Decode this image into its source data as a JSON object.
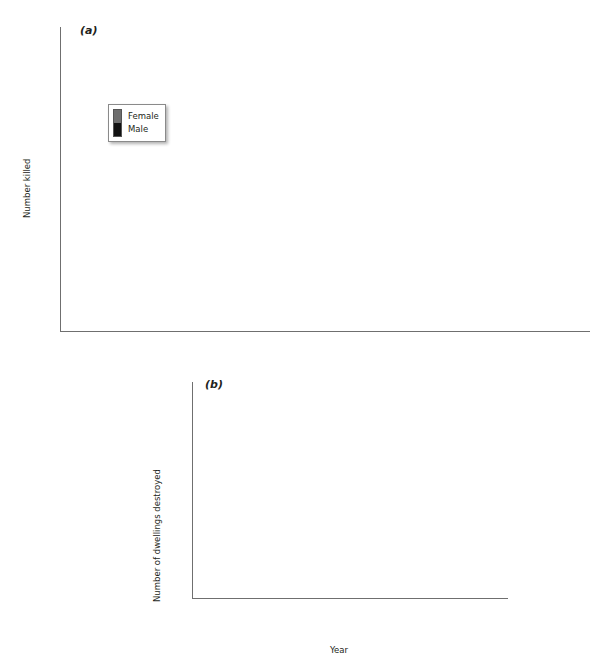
{
  "figure": {
    "background": "#ffffff",
    "male_color": "#111111",
    "female_color": "#6e6e6e",
    "axis_color": "#6f6f6f"
  },
  "panel_a": {
    "letter": "(a)",
    "ytitle": "Number killed",
    "yticks": [
      "0",
      "10",
      "20",
      "30",
      "40",
      "50",
      "60",
      "70",
      "80"
    ],
    "legend": {
      "female": "Female",
      "male": "Male"
    }
  },
  "panel_b": {
    "letter": "(b)",
    "ytitle": "Number of dwellings destroyed",
    "xtitle": "Year",
    "yticks": [
      "0",
      "500",
      "1000",
      "1500",
      "2000",
      "2500"
    ],
    "annotations": [
      {
        "name": "Black Friday",
        "year": "1939"
      },
      {
        "name": "Hobart",
        "year": "1967"
      },
      {
        "name": "Ash Wednesday",
        "year": "1983"
      },
      {
        "name": "Sydney",
        "year": "1994"
      },
      {
        "name": "Canberra",
        "year": "2003"
      }
    ]
  },
  "chart_data": [
    {
      "type": "bar",
      "id": "panel_a",
      "title": "(a)",
      "subtitle": "Bushfire fatalities by year, split by sex",
      "stacked": true,
      "xlabel": "",
      "ylabel": "Number killed",
      "ylim": [
        0,
        80
      ],
      "ytick_step": 10,
      "grid": false,
      "legend": [
        "Female",
        "Male"
      ],
      "legend_position": "upper-left-inside",
      "tick_labels": [
        "1904",
        "1908",
        "1915",
        "1919",
        "1926",
        "1932",
        "1936",
        "1942",
        "1951",
        "1954",
        "1958",
        "1965",
        "1969",
        "1977",
        "1980",
        "1985",
        "1994",
        "2002",
        "2006"
      ],
      "categories": [
        "1901",
        "1904",
        "1905",
        "1906",
        "1908",
        "1912",
        "1915",
        "1916",
        "1919",
        "1920",
        "1922",
        "1926",
        "1929",
        "1932",
        "1933",
        "1936",
        "1939",
        "1940",
        "1942",
        "1943",
        "1944",
        "1951",
        "1952",
        "1954",
        "1955",
        "1958",
        "1959",
        "1962",
        "1965",
        "1967",
        "1969",
        "1972",
        "1977",
        "1978",
        "1980",
        "1983",
        "1985",
        "1990",
        "1994",
        "1997",
        "2002",
        "2003",
        "2005",
        "2006",
        "2007"
      ],
      "series": [
        {
          "name": "Male",
          "values": [
            1,
            8,
            5,
            14,
            4,
            1,
            1,
            1,
            4,
            1,
            3,
            2,
            5,
            1,
            3,
            1,
            68,
            1,
            29,
            1,
            1,
            13,
            1,
            2,
            4,
            4,
            1,
            12,
            36,
            2,
            5,
            3,
            7,
            1,
            1,
            36,
            5,
            2,
            5,
            3,
            6,
            4,
            3,
            5,
            4
          ]
        },
        {
          "name": "Female",
          "values": [
            0,
            1,
            0,
            2,
            0,
            0,
            0,
            0,
            0,
            0,
            0,
            0,
            1,
            0,
            0,
            0,
            11,
            0,
            13,
            0,
            0,
            7,
            0,
            0,
            0,
            1,
            0,
            5,
            29,
            1,
            4,
            0,
            1,
            0,
            0,
            24,
            2,
            0,
            1,
            0,
            3,
            1,
            0,
            0,
            1
          ]
        }
      ],
      "total_values": [
        1,
        9,
        5,
        16,
        4,
        1,
        1,
        1,
        4,
        1,
        3,
        2,
        6,
        1,
        3,
        1,
        79,
        1,
        42,
        1,
        1,
        20,
        1,
        2,
        4,
        5,
        1,
        17,
        65,
        3,
        9,
        3,
        8,
        1,
        1,
        60,
        7,
        2,
        6,
        3,
        9,
        5,
        3,
        5,
        5
      ]
    },
    {
      "type": "bar",
      "id": "panel_b",
      "title": "(b)",
      "subtitle": "Dwellings destroyed by bushfire by year",
      "stacked": false,
      "xlabel": "Year",
      "ylabel": "Number of dwellings destroyed",
      "ylim": [
        0,
        2500
      ],
      "ytick_step": 500,
      "grid": false,
      "tick_labels": [
        "1926",
        "1931",
        "1934",
        "1938",
        "1942",
        "1946",
        "1961",
        "1968",
        "1979",
        "1982",
        "1985",
        "1991",
        "1995",
        "2002"
      ],
      "categories": [
        "1926",
        "1928",
        "1931",
        "1932",
        "1933",
        "1934",
        "1936",
        "1938",
        "1939",
        "1940",
        "1942",
        "1944",
        "1946",
        "1951",
        "1952",
        "1955",
        "1957",
        "1958",
        "1961",
        "1962",
        "1965",
        "1967",
        "1968",
        "1969",
        "1972",
        "1977",
        "1979",
        "1980",
        "1982",
        "1983",
        "1984",
        "1985",
        "1990",
        "1991",
        "1993",
        "1994",
        "1995",
        "1997",
        "2001",
        "2002",
        "2003",
        "2005"
      ],
      "values": [
        250,
        5,
        20,
        5,
        45,
        60,
        5,
        70,
        15,
        775,
        130,
        40,
        5,
        645,
        5,
        110,
        290,
        155,
        235,
        1540,
        80,
        135,
        5,
        345,
        50,
        100,
        60,
        20,
        5,
        2310,
        30,
        20,
        100,
        70,
        5,
        570,
        5,
        40,
        130,
        25,
        550,
        45
      ]
    }
  ]
}
